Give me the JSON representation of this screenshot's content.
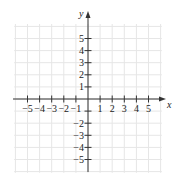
{
  "chart_data": {
    "type": "scatter",
    "title": "",
    "xlabel": "x",
    "ylabel": "y",
    "xlim": [
      -6,
      6
    ],
    "ylim": [
      -6,
      6
    ],
    "grid": true,
    "x_ticks": [
      -5,
      -4,
      -3,
      -2,
      -1,
      1,
      2,
      3,
      4,
      5
    ],
    "x_tick_labels": [
      "−5",
      "−4",
      "−3",
      "−2",
      "−1",
      "1",
      "2",
      "3",
      "4",
      "5"
    ],
    "y_ticks": [
      5,
      4,
      3,
      2,
      1,
      -1,
      -2,
      -3,
      -4,
      -5
    ],
    "y_tick_labels": [
      "5",
      "4",
      "3",
      "2",
      "1",
      "",
      "−2",
      "−3",
      "−4",
      "−5"
    ],
    "points": [],
    "legend": null
  },
  "colors": {
    "axis": "#333333",
    "grid": "#e6e6e6",
    "background": "#ffffff"
  }
}
